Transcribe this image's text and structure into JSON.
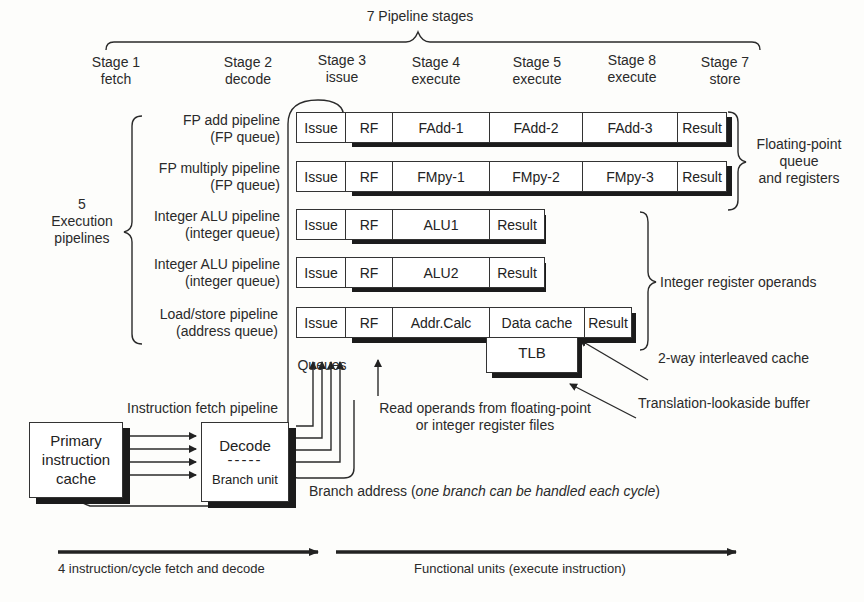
{
  "title": "7 Pipeline stages",
  "stages": [
    {
      "line1": "Stage 1",
      "line2": "fetch"
    },
    {
      "line1": "Stage 2",
      "line2": "decode"
    },
    {
      "line1": "Stage 3",
      "line2": "issue"
    },
    {
      "line1": "Stage 4",
      "line2": "execute"
    },
    {
      "line1": "Stage 5",
      "line2": "execute"
    },
    {
      "line1": "Stage 8",
      "line2": "execute"
    },
    {
      "line1": "Stage 7",
      "line2": "store"
    }
  ],
  "execution_group": {
    "line1": "5",
    "line2": "Execution",
    "line3": "pipelines"
  },
  "pipelines": [
    {
      "name": "FP add pipeline",
      "queue": "(FP queue)",
      "cells": [
        "Issue",
        "RF",
        "FAdd-1",
        "FAdd-2",
        "FAdd-3",
        "Result"
      ]
    },
    {
      "name": "FP multiply pipeline",
      "queue": "(FP queue)",
      "cells": [
        "Issue",
        "RF",
        "FMpy-1",
        "FMpy-2",
        "FMpy-3",
        "Result"
      ]
    },
    {
      "name": "Integer ALU pipeline",
      "queue": "(integer queue)",
      "cells": [
        "Issue",
        "RF",
        "ALU1",
        "Result"
      ]
    },
    {
      "name": "Integer ALU pipeline",
      "queue": "(integer queue)",
      "cells": [
        "Issue",
        "RF",
        "ALU2",
        "Result"
      ]
    },
    {
      "name": "Load/store pipeline",
      "queue": "(address queue)",
      "cells": [
        "Issue",
        "RF",
        "Addr.Calc",
        "Data cache",
        "Result"
      ]
    }
  ],
  "tlb": "TLB",
  "annotations": {
    "fp_group": {
      "line1": "Floating-point",
      "line2": "queue",
      "line3": "and registers"
    },
    "int_operands": "Integer register operands",
    "two_way_cache": "2-way interleaved cache",
    "tlb_full": "Translation-lookaside buffer",
    "queues": "Queues",
    "read_operands": {
      "line1": "Read operands from floating-point",
      "line2": "or integer register files"
    },
    "fetch_pipeline": "Instruction fetch pipeline",
    "branch_address_prefix": "Branch address (",
    "branch_address_italic": "one branch can be handled each cycle",
    "branch_address_suffix": ")"
  },
  "fetch_unit": {
    "cache": {
      "line1": "Primary",
      "line2": "instruction",
      "line3": "cache"
    },
    "decode": "Decode",
    "divider": "-----",
    "branch_unit": "Branch unit"
  },
  "footer": {
    "left_arrow": "4 instruction/cycle fetch and decode",
    "right_arrow": "Functional units (execute instruction)"
  },
  "colors": {
    "ink": "#222222",
    "shadow": "#1b1b1b",
    "paper": "#fdfdfb"
  }
}
